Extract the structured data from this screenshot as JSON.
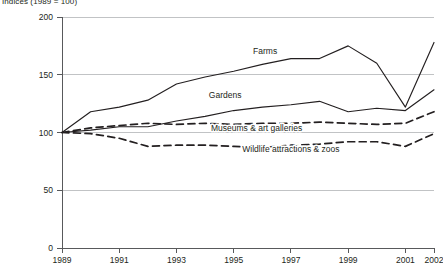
{
  "chart_data": {
    "type": "line",
    "title": "Indices (1989 = 100)",
    "xlabel": "",
    "ylabel": "",
    "xlim": [
      1989,
      2002
    ],
    "ylim": [
      0,
      200
    ],
    "yticks": [
      0,
      50,
      100,
      150,
      200
    ],
    "ytick_labels": [
      "0",
      "50",
      "100",
      "150",
      "200"
    ],
    "xticks": [
      1989,
      1991,
      1993,
      1995,
      1997,
      1999,
      2001,
      2002
    ],
    "xtick_labels": [
      "1989",
      "1991",
      "1993",
      "1995",
      "1997",
      "1999",
      "2001",
      "2002"
    ],
    "grid": true,
    "legend_position": "inline-annotations",
    "x": [
      1989,
      1990,
      1991,
      1992,
      1993,
      1994,
      1995,
      1996,
      1997,
      1998,
      1999,
      2000,
      2001,
      2002
    ],
    "series": [
      {
        "name": "Farms",
        "style": "solid",
        "label_x": 1996.1,
        "label_y": 168,
        "values": [
          100,
          118,
          122,
          128,
          142,
          148,
          153,
          159,
          164,
          164,
          175,
          160,
          122,
          178
        ]
      },
      {
        "name": "Gardens",
        "style": "solid",
        "label_x": 1994.7,
        "label_y": 130,
        "values": [
          100,
          102,
          105,
          105,
          110,
          114,
          119,
          122,
          124,
          127,
          118,
          121,
          119,
          137
        ]
      },
      {
        "name": "Museums & art galleries",
        "style": "dashed",
        "label_x": 1995.8,
        "label_y": 101,
        "values": [
          100,
          104,
          106,
          108,
          107,
          108,
          107,
          108,
          108,
          109,
          108,
          107,
          108,
          118
        ]
      },
      {
        "name": "Wildlife attractions & zoos",
        "style": "dashed",
        "label_x": 1997.0,
        "label_y": 83,
        "values": [
          100,
          99,
          95,
          88,
          89,
          89,
          88,
          87,
          89,
          90,
          92,
          92,
          88,
          99
        ]
      }
    ]
  },
  "colors": {
    "line": "#231f20",
    "grid": "#a7a9ac",
    "axis": "#58595b",
    "background": "#ffffff"
  }
}
